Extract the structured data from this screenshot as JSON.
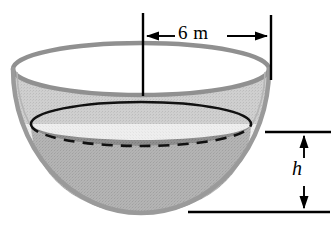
{
  "figure": {
    "dimensions": {
      "diameter": {
        "label": "6 m",
        "value": 6,
        "unit": "m",
        "name": "bowl-diameter"
      },
      "water_depth": {
        "label": "h",
        "value": "h",
        "unit": "",
        "name": "water-depth"
      }
    },
    "colors": {
      "background": "#ffffff",
      "bowl_rim_stroke": "#8f8f8f",
      "bowl_outer_stroke": "#9a9a9a",
      "bowl_interior_upper": "#c9c9c9",
      "bowl_interior_lower": "#ececec",
      "water_fill": "#b0b0b0",
      "water_band": "#8c8c8c",
      "waterline_stroke": "#000000",
      "dimension_line": "#000000",
      "dashed_hidden_edge": "#000000"
    },
    "geometry": {
      "bowl_center_x": 141,
      "bowl_top_y": 69,
      "bowl_bottom_y": 213,
      "bowl_left_x": 13,
      "bowl_right_x": 269,
      "rim_ellipse_ry": 26,
      "waterline_y": 124,
      "waterline_rx": 110,
      "waterline_ry": 22
    },
    "annotations": {
      "diameter_arrow_y": 36,
      "diameter_tick_left_x": 143,
      "diameter_tick_right_x": 271,
      "height_line_top_y": 132,
      "height_line_bottom_y": 212,
      "height_arrow_x": 304
    }
  }
}
